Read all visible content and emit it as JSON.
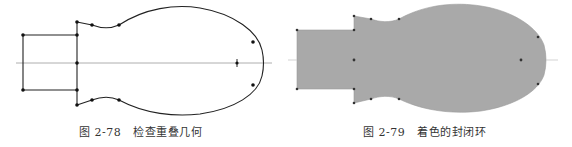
{
  "figures": [
    {
      "id": "fig-2-78",
      "caption_number": "图 2-78",
      "caption_title": "检查重叠几何",
      "style": "outline",
      "stroke_color": "#222222",
      "centerline_color": "#999999"
    },
    {
      "id": "fig-2-79",
      "caption_number": "图 2-79",
      "caption_title": "着色的封闭环",
      "style": "filled",
      "fill_color": "#a9a9a9",
      "centerline_color": "#bbbbbb"
    }
  ]
}
